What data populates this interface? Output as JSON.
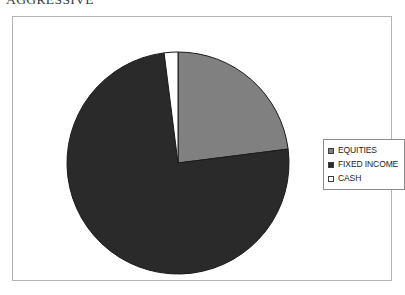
{
  "title": "AGGRESSIVE",
  "legend": {
    "position": "right",
    "items": [
      {
        "label": "EQUITIES",
        "color": "#808080",
        "swatch": "legend-swatch-equities"
      },
      {
        "label": "FIXED INCOME",
        "color": "#2a2a2a",
        "swatch": "legend-swatch-fixed-income"
      },
      {
        "label": "CASH",
        "color": "#ffffff",
        "swatch": "legend-swatch-cash"
      }
    ]
  },
  "colors": {
    "equities": "#808080",
    "fixed_income": "#2a2a2a",
    "cash": "#ffffff",
    "slice_outline": "#1a1a1a",
    "frame_border": "#b4b4b4",
    "legend_border": "#8c8c8c",
    "background": "#ffffff",
    "title_text": "#3a3a3a"
  },
  "chart_data": {
    "type": "pie",
    "title": "AGGRESSIVE",
    "xlabel": "",
    "ylabel": "",
    "grid": false,
    "legend_position": "right",
    "start_angle_deg": 0,
    "direction": "clockwise",
    "categories": [
      "EQUITIES",
      "FIXED INCOME",
      "CASH"
    ],
    "values": [
      23,
      75,
      2
    ],
    "units": "percent",
    "slices": [
      {
        "label": "EQUITIES",
        "value": 23,
        "color": "#808080"
      },
      {
        "label": "FIXED INCOME",
        "value": 75,
        "color": "#2a2a2a"
      },
      {
        "label": "CASH",
        "value": 2,
        "color": "#ffffff"
      }
    ]
  }
}
